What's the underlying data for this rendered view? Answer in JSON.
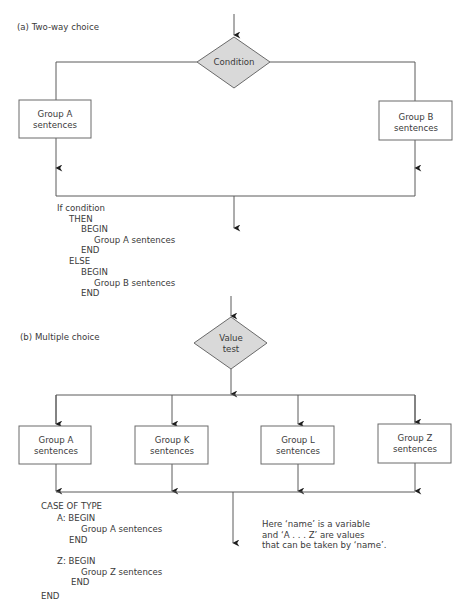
{
  "part_a": {
    "label": "(a) Two-way choice",
    "decision": "Condition",
    "branches": [
      {
        "line1": "Group A",
        "line2": "sentences"
      },
      {
        "line1": "Group B",
        "line2": "sentences"
      }
    ],
    "pseudocode": [
      "If condition",
      "THEN",
      "BEGIN",
      "Group A sentences",
      "END",
      "ELSE",
      "BEGIN",
      "Group B sentences",
      "END"
    ]
  },
  "part_b": {
    "label": "(b) Multiple choice",
    "decision": {
      "line1": "Value",
      "line2": "test"
    },
    "branches": [
      {
        "line1": "Group A",
        "line2": "sentences"
      },
      {
        "line1": "Group K",
        "line2": "sentences"
      },
      {
        "line1": "Group L",
        "line2": "sentences"
      },
      {
        "line1": "Group Z",
        "line2": "sentences"
      }
    ],
    "pseudocode": [
      "CASE OF TYPE",
      "A: BEGIN",
      "Group A sentences",
      "END",
      "Z: BEGIN",
      "Group Z sentences",
      "END",
      "END"
    ],
    "note": [
      "Here ‘name’ is a variable",
      "and ‘A . . . Z’ are values",
      "that can be taken by ‘name’."
    ]
  },
  "colors": {
    "decision_fill": "#d9d9d9",
    "line": "#5a5a5a",
    "text": "#3a3a3a"
  }
}
